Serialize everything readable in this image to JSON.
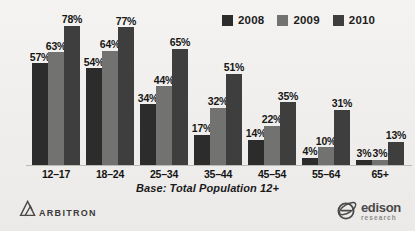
{
  "chart_data": {
    "type": "bar",
    "title": "",
    "subtitle": "",
    "xlabel": "",
    "ylabel": "",
    "ylim": [
      0,
      80
    ],
    "grid": false,
    "legend_position": "top-right",
    "categories": [
      "12–17",
      "18–24",
      "25–34",
      "35–44",
      "45–54",
      "55–64",
      "65+"
    ],
    "series": [
      {
        "name": "2008",
        "color": "#2c2c2c",
        "values": [
          57,
          54,
          34,
          17,
          14,
          4,
          3
        ],
        "labels": [
          "57%",
          "54%",
          "34%",
          "17%",
          "14%",
          "4%",
          "3%"
        ]
      },
      {
        "name": "2009",
        "color": "#727270",
        "values": [
          63,
          64,
          44,
          32,
          22,
          10,
          3
        ],
        "labels": [
          "63%",
          "64%",
          "44%",
          "32%",
          "22%",
          "10%",
          "3%"
        ]
      },
      {
        "name": "2010",
        "color": "#3e3e3e",
        "values": [
          78,
          77,
          65,
          51,
          35,
          31,
          13
        ],
        "labels": [
          "78%",
          "77%",
          "65%",
          "51%",
          "35%",
          "31%",
          "13%"
        ]
      }
    ],
    "annotation": "Base: Total Population 12+"
  },
  "legend": {
    "items": [
      {
        "label": "2008",
        "color": "#2c2c2c"
      },
      {
        "label": "2009",
        "color": "#727270"
      },
      {
        "label": "2010",
        "color": "#3e3e3e"
      }
    ]
  },
  "caption": {
    "text": "Base: Total Population 12+"
  },
  "footer": {
    "arbitron": {
      "wordmark": "ARBITRON",
      "mark": "delta-triangle-icon"
    },
    "edison": {
      "name": "edison",
      "subtitle": "research",
      "mark": "orbit-e-icon"
    }
  }
}
